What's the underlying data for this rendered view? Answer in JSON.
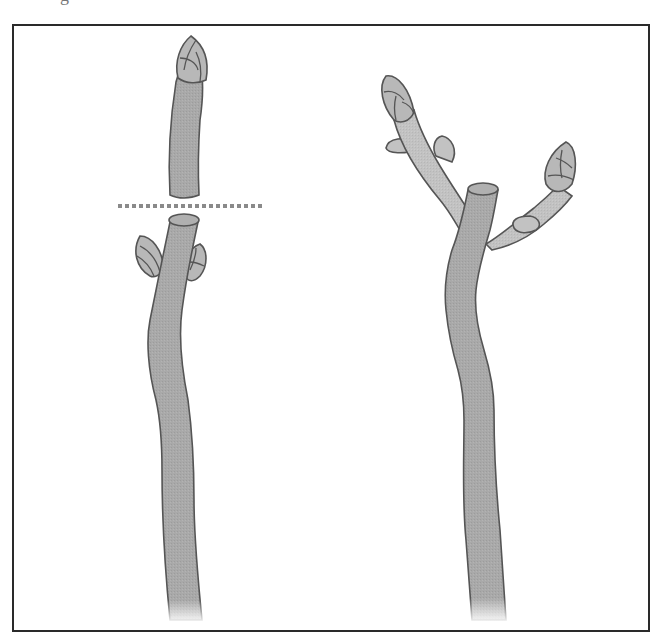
{
  "caption_fragment": "g",
  "figure": {
    "panels": [
      {
        "id": "before",
        "label": "",
        "elements": [
          "removed-shoot-tip",
          "cut-line",
          "stem-with-lateral-buds"
        ]
      },
      {
        "id": "after",
        "label": "",
        "elements": [
          "main-stem-stub",
          "left-new-branch",
          "right-new-branch"
        ]
      }
    ]
  },
  "colors": {
    "frame": "#2a2a2a",
    "stem_fill": "#a9a9a9",
    "branch_fill": "#c2c2c2",
    "bud_fill": "#b8b8b8",
    "outline": "#555555",
    "cut_line": "#8a8a8a",
    "background": "#ffffff"
  }
}
